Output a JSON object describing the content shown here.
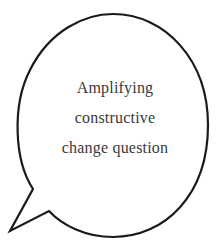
{
  "bubble": {
    "lines": [
      "Amplifying",
      "constructive",
      "change question"
    ],
    "stroke_color": "#1a1a1a",
    "fill_color": "#ffffff",
    "text_color": "#3a3a3a"
  }
}
